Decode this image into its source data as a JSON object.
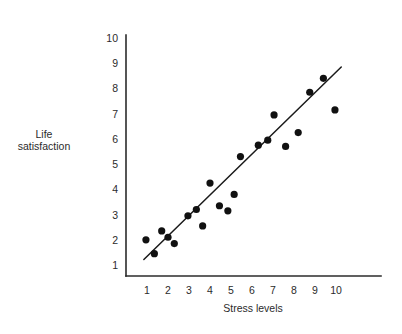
{
  "figure": {
    "top_caption": "",
    "background_color": "#ffffff",
    "point_color": "#111111",
    "line_color": "#1a1a1a",
    "axis_color": "#2b2b2b"
  },
  "chart_data": {
    "type": "scatter",
    "title": "",
    "xlabel": "Stress levels",
    "ylabel": "Life satisfaction",
    "ylabel_lines": [
      "Life",
      "satisfaction"
    ],
    "xlim": [
      0.4,
      10.8
    ],
    "ylim": [
      0.6,
      10.4
    ],
    "xticks": [
      1,
      2,
      3,
      4,
      5,
      6,
      7,
      8,
      9,
      10
    ],
    "yticks": [
      1,
      2,
      3,
      4,
      5,
      6,
      7,
      8,
      9,
      10
    ],
    "xtick_labels": [
      "1",
      "2",
      "3",
      "4",
      "5",
      "6",
      "7",
      "8",
      "9",
      "10"
    ],
    "ytick_labels": [
      "1",
      "2",
      "3",
      "4",
      "5",
      "6",
      "7",
      "8",
      "9",
      "10"
    ],
    "grid": false,
    "legend": null,
    "points": [
      {
        "x": 0.95,
        "y": 2.0
      },
      {
        "x": 1.35,
        "y": 1.45
      },
      {
        "x": 1.7,
        "y": 2.35
      },
      {
        "x": 2.0,
        "y": 2.1
      },
      {
        "x": 2.3,
        "y": 1.85
      },
      {
        "x": 2.95,
        "y": 2.95
      },
      {
        "x": 3.35,
        "y": 3.2
      },
      {
        "x": 3.65,
        "y": 2.55
      },
      {
        "x": 4.0,
        "y": 4.25
      },
      {
        "x": 4.45,
        "y": 3.35
      },
      {
        "x": 4.85,
        "y": 3.15
      },
      {
        "x": 5.15,
        "y": 3.8
      },
      {
        "x": 5.45,
        "y": 5.3
      },
      {
        "x": 6.3,
        "y": 5.75
      },
      {
        "x": 6.75,
        "y": 5.95
      },
      {
        "x": 7.05,
        "y": 6.95
      },
      {
        "x": 7.6,
        "y": 5.7
      },
      {
        "x": 8.2,
        "y": 6.25
      },
      {
        "x": 8.75,
        "y": 7.85
      },
      {
        "x": 9.4,
        "y": 8.4
      },
      {
        "x": 9.95,
        "y": 7.15
      }
    ],
    "trend_line": {
      "type": "linear-fit",
      "x_start": 0.85,
      "y_start": 1.22,
      "x_end": 10.25,
      "y_end": 8.85
    }
  }
}
